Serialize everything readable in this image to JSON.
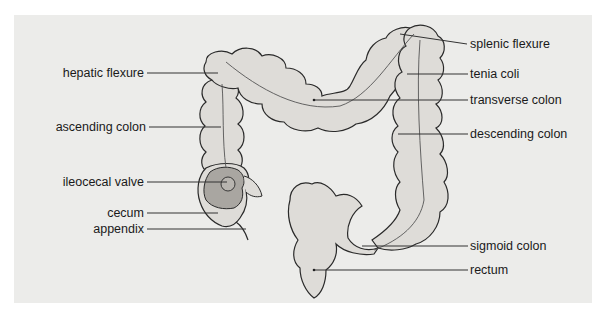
{
  "diagram": {
    "colors": {
      "background_panel": "#ececea",
      "organ_fill": "#dedcd8",
      "organ_outline": "#2a2a2a",
      "cecum_interior": "#a9a6a1",
      "leader_line": "#333333",
      "text": "#1a1a1a"
    },
    "labels_left": [
      {
        "id": "hepatic-flexure",
        "text": "hepatic flexure"
      },
      {
        "id": "ascending-colon",
        "text": "ascending colon"
      },
      {
        "id": "ileocecal-valve",
        "text": "ileocecal valve"
      },
      {
        "id": "cecum",
        "text": "cecum"
      },
      {
        "id": "appendix",
        "text": "appendix"
      }
    ],
    "labels_right": [
      {
        "id": "splenic-flexure",
        "text": "splenic flexure"
      },
      {
        "id": "tenia-coli",
        "text": "tenia coli"
      },
      {
        "id": "transverse-colon",
        "text": "transverse colon"
      },
      {
        "id": "descending-colon",
        "text": "descending colon"
      },
      {
        "id": "sigmoid-colon",
        "text": "sigmoid colon"
      },
      {
        "id": "rectum",
        "text": "rectum"
      }
    ]
  }
}
